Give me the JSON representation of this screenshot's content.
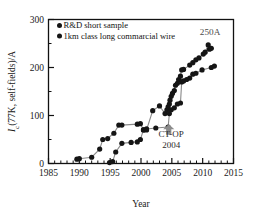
{
  "chart_data": {
    "type": "scatter",
    "title": "",
    "xlabel": "Year",
    "ylabel": "Ic(77K, self-fields)/A",
    "ylabel_parts": {
      "italic": "I",
      "sub": "c",
      "rest": "(77K, self-fields)/A"
    },
    "xlim": [
      1985,
      2015
    ],
    "ylim": [
      0,
      300
    ],
    "xticks": [
      1985,
      1990,
      1995,
      2000,
      2005,
      2010,
      2015
    ],
    "yticks": [
      0,
      100,
      200,
      300
    ],
    "xtick_labels": [
      "1985",
      "1990",
      "1995",
      "2000",
      "2005",
      "2010",
      "2015"
    ],
    "ytick_labels": [
      "0",
      "100",
      "200",
      "300"
    ],
    "x_minor_tick_interval": 1,
    "y_minor_tick_interval": 50,
    "grid": false,
    "legend_position": "top-left-inside",
    "marker": "filled-circle",
    "line_color": "#8a8a8a",
    "marker_color": "#151515",
    "series": [
      {
        "name": "R&D short sample",
        "points": [
          [
            1989.6,
            9
          ],
          [
            1990.0,
            10
          ],
          [
            1992.0,
            13
          ],
          [
            1993.3,
            30
          ],
          [
            1993.8,
            50
          ],
          [
            1994.6,
            52
          ],
          [
            1995.6,
            63
          ],
          [
            1996.4,
            80
          ],
          [
            1996.9,
            80
          ],
          [
            1999.4,
            82
          ],
          [
            1999.9,
            83
          ],
          [
            2000.4,
            70
          ],
          [
            2000.9,
            70
          ],
          [
            2001.9,
            110
          ],
          [
            2003.0,
            120
          ],
          [
            2003.9,
            104
          ],
          [
            2004.2,
            112
          ],
          [
            2004.4,
            118
          ],
          [
            2004.6,
            124
          ],
          [
            2004.7,
            132
          ],
          [
            2004.9,
            140
          ],
          [
            2005.1,
            146
          ],
          [
            2005.4,
            152
          ],
          [
            2005.6,
            163
          ],
          [
            2005.9,
            167
          ],
          [
            2006.1,
            175
          ],
          [
            2006.4,
            182
          ],
          [
            2006.6,
            195
          ],
          [
            2006.9,
            196
          ],
          [
            2007.9,
            205
          ],
          [
            2008.4,
            210
          ],
          [
            2008.9,
            216
          ],
          [
            2009.4,
            220
          ],
          [
            2010.1,
            228
          ],
          [
            2010.4,
            232
          ],
          [
            2010.9,
            247
          ],
          [
            2011.1,
            238
          ],
          [
            2011.4,
            240
          ]
        ]
      },
      {
        "name": "1km class long commarcial wire",
        "points": [
          [
            1994.9,
            2
          ],
          [
            1995.4,
            4
          ],
          [
            1995.9,
            24
          ],
          [
            1996.9,
            42
          ],
          [
            1998.4,
            44
          ],
          [
            1999.4,
            45
          ],
          [
            1999.9,
            50
          ],
          [
            2000.4,
            70
          ],
          [
            2000.9,
            72
          ],
          [
            2002.4,
            74
          ],
          [
            2004.4,
            76
          ],
          [
            2004.6,
            104
          ],
          [
            2004.9,
            112
          ],
          [
            2005.4,
            116
          ],
          [
            2005.9,
            124
          ],
          [
            2006.4,
            126
          ],
          [
            2006.6,
            170
          ],
          [
            2006.9,
            172
          ],
          [
            2007.4,
            175
          ],
          [
            2007.9,
            178
          ],
          [
            2008.4,
            186
          ],
          [
            2008.9,
            188
          ],
          [
            2009.9,
            195
          ],
          [
            2011.4,
            200
          ],
          [
            2011.9,
            203
          ]
        ]
      }
    ],
    "annotations": [
      {
        "text": "250A",
        "x": 2011.2,
        "y": 268,
        "name": "annotation-250a"
      },
      {
        "text": "CT-OP",
        "x": 2004.9,
        "y": 55,
        "name": "annotation-ct-op"
      },
      {
        "text": "2004",
        "x": 2004.9,
        "y": 33,
        "name": "annotation-year-2004"
      }
    ],
    "arrow": {
      "x": 2004.5,
      "y_from": 60,
      "y_to": 82,
      "color": "#8c8c8c",
      "name": "ct-op-arrow"
    }
  },
  "legend": {
    "items": [
      {
        "label": "R&D short sample",
        "marker": "filled-circle"
      },
      {
        "label": "1km class long commarcial wire",
        "marker": "filled-circle"
      }
    ]
  }
}
